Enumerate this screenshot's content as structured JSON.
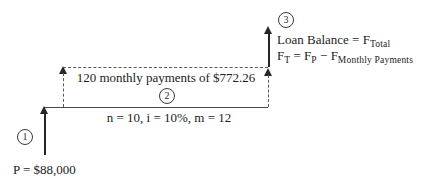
{
  "diagram": {
    "type": "cash-flow-diagram",
    "background_color": "#ffffff",
    "axis_color": "#4a4a4a",
    "arrow_color": "#262626",
    "dash_color": "#5a5a5a",
    "markers": [
      {
        "label": "1"
      },
      {
        "label": "2"
      },
      {
        "label": "3"
      }
    ],
    "principal_label": "P = $88,000",
    "payments_label": "120 monthly payments of $772.26",
    "terms_label": "n = 10, i = 10%, m = 12",
    "loan_balance": {
      "line1_main": "Loan Balance = F",
      "line1_sub": "Total",
      "line2_f1": "F",
      "line2_sub1": "T",
      "line2_mid1": " = F",
      "line2_sub2": "P",
      "line2_mid2": " − F",
      "line2_sub3": "Monthly Payments"
    }
  }
}
